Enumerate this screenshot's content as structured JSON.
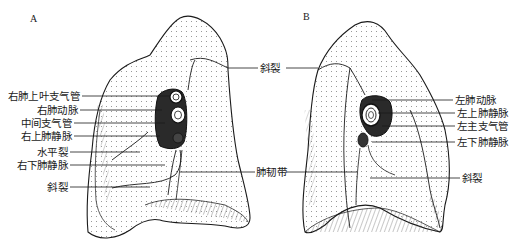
{
  "figure": {
    "panels": [
      {
        "id": "A",
        "letter": "A",
        "subject": "right-lung-mediastinal-surface",
        "labels": [
          {
            "key": "right_upper_lobe_bronchus",
            "text": "右肺上叶支气管"
          },
          {
            "key": "right_pulmonary_artery",
            "text": "右肺动脉"
          },
          {
            "key": "intermediate_bronchus",
            "text": "中间支气管"
          },
          {
            "key": "right_superior_pulmonary_vein",
            "text": "右上肺静脉"
          },
          {
            "key": "horizontal_fissure",
            "text": "水平裂"
          },
          {
            "key": "right_inferior_pulmonary_vein",
            "text": "右下肺静脉"
          },
          {
            "key": "oblique_fissure",
            "text": "斜裂"
          }
        ]
      },
      {
        "id": "B",
        "letter": "B",
        "subject": "left-lung-mediastinal-surface",
        "labels": [
          {
            "key": "left_pulmonary_artery",
            "text": "左肺动脉"
          },
          {
            "key": "left_superior_pulmonary_vein",
            "text": "左上肺静脉"
          },
          {
            "key": "left_main_bronchus",
            "text": "左主支气管"
          },
          {
            "key": "left_inferior_pulmonary_vein",
            "text": "左下肺静脉"
          },
          {
            "key": "oblique_fissure",
            "text": "斜裂"
          }
        ]
      }
    ],
    "shared_labels": [
      {
        "key": "oblique_fissure_center",
        "text": "斜裂"
      },
      {
        "key": "pulmonary_ligament",
        "text": "肺韧带"
      }
    ],
    "colors": {
      "ink": "#1a1a1a",
      "background": "#ffffff",
      "hatch": "#555555"
    }
  }
}
